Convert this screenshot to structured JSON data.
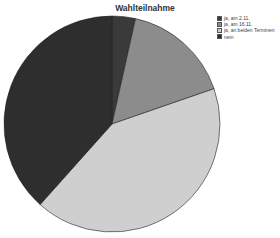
{
  "chart_data": {
    "type": "pie",
    "title": "Wahlteilnahme",
    "categories": [
      "ja, am 2.11.",
      "ja, am 16.11.",
      "ja, an beiden Terminen",
      "nein"
    ],
    "values": [
      3.5,
      16.2,
      41.9,
      38.4
    ],
    "value_unit": "percent (estimated from slice angles)",
    "colors": [
      "#3a3a3a",
      "#8c8c8c",
      "#cfcfcf",
      "#2e2e2e"
    ],
    "start_angle_deg": 0,
    "direction": "clockwise",
    "legend_position": "top-right",
    "center": [
      112,
      124
    ],
    "radius": 108
  },
  "legend": {
    "items": [
      {
        "label": "ja, am 2.11.",
        "color": "#3a3a3a"
      },
      {
        "label": "ja, am 16.11.",
        "color": "#8c8c8c"
      },
      {
        "label": "ja, an beiden Terminen",
        "color": "#cfcfcf"
      },
      {
        "label": "nein",
        "color": "#2e2e2e"
      }
    ]
  }
}
